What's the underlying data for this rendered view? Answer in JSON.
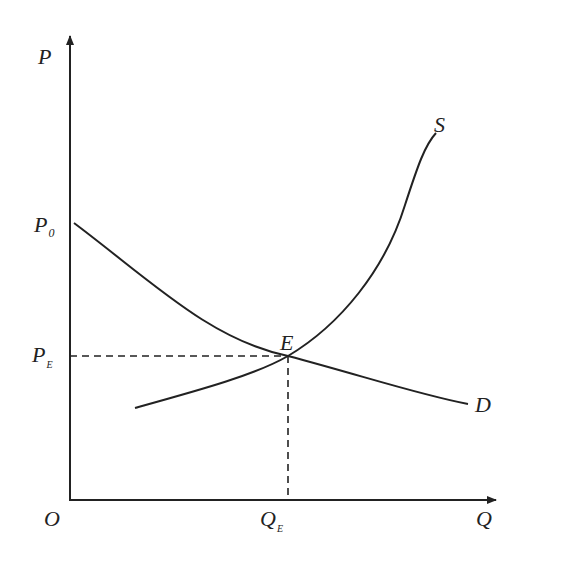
{
  "diagram": {
    "type": "supply-demand",
    "axes": {
      "y_label": "P",
      "x_label": "Q",
      "origin_label": "O"
    },
    "price_labels": {
      "p0": {
        "main": "P",
        "sub": "0"
      },
      "pe": {
        "main": "P",
        "sub": "E"
      }
    },
    "quantity_labels": {
      "qe": {
        "main": "Q",
        "sub": "E"
      }
    },
    "curves": {
      "supply": "S",
      "demand": "D"
    },
    "equilibrium_label": "E",
    "colors": {
      "line": "#222222",
      "background": "#ffffff"
    }
  }
}
